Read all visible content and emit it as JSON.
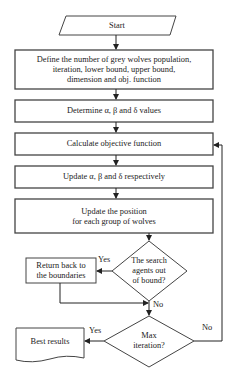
{
  "flowchart": {
    "nodes": [
      {
        "id": "start",
        "shape": "parallelogram",
        "label": "Start"
      },
      {
        "id": "define",
        "shape": "process",
        "label": "Define the number of grey wolves population, iteration, lower bound, upper bound, dimension and obj. function"
      },
      {
        "id": "determine",
        "shape": "process",
        "label": "Determine α, β and δ values"
      },
      {
        "id": "calculate",
        "shape": "process",
        "label": "Calculate objective function"
      },
      {
        "id": "update_abd",
        "shape": "process",
        "label": "Update α, β and δ respectively"
      },
      {
        "id": "update_pos",
        "shape": "process",
        "label": "Update the position for each group of wolves"
      },
      {
        "id": "bound_check",
        "shape": "decision",
        "label": "The search agents out of bound?"
      },
      {
        "id": "return_bounds",
        "shape": "process",
        "label": "Return back to the boundaries"
      },
      {
        "id": "max_iter",
        "shape": "decision",
        "label": "Max iteration?"
      },
      {
        "id": "best",
        "shape": "document",
        "label": "Best results"
      }
    ],
    "edges": [
      {
        "from": "start",
        "to": "define",
        "label": ""
      },
      {
        "from": "define",
        "to": "determine",
        "label": ""
      },
      {
        "from": "determine",
        "to": "calculate",
        "label": ""
      },
      {
        "from": "calculate",
        "to": "update_abd",
        "label": ""
      },
      {
        "from": "update_abd",
        "to": "update_pos",
        "label": ""
      },
      {
        "from": "update_pos",
        "to": "bound_check",
        "label": ""
      },
      {
        "from": "bound_check",
        "to": "return_bounds",
        "label": "Yes"
      },
      {
        "from": "bound_check",
        "to": "max_iter",
        "label": "No"
      },
      {
        "from": "return_bounds",
        "to": "max_iter",
        "label": ""
      },
      {
        "from": "max_iter",
        "to": "best",
        "label": "Yes"
      },
      {
        "from": "max_iter",
        "to": "calculate",
        "label": "No"
      }
    ]
  },
  "text": {
    "start": "Start",
    "define_l1": "Define the number of grey wolves population,",
    "define_l2": "iteration, lower bound, upper bound,",
    "define_l3": "dimension and obj. function",
    "determine": "Determine α, β and δ values",
    "calculate": "Calculate objective function",
    "update_abd": "Update α, β and δ respectively",
    "update_pos_l1": "Update the position",
    "update_pos_l2": "for each group of wolves",
    "bound_l1": "The search",
    "bound_l2": "agents out",
    "bound_l3": "of bound?",
    "return_l1": "Return back to",
    "return_l2": "the boundaries",
    "max_l1": "Max",
    "max_l2": "iteration?",
    "best": "Best results",
    "yes1": "Yes",
    "no1": "No",
    "yes2": "Yes",
    "no2": "No"
  },
  "colors": {
    "stroke": "#333333",
    "background": "#ffffff",
    "text": "#222222"
  }
}
